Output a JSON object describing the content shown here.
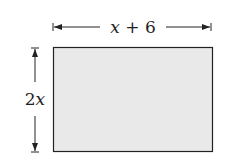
{
  "diagram": {
    "shape": "rectangle",
    "fill_color": "#e9e9e9",
    "stroke_color": "#222222",
    "width_label": {
      "var": "x",
      "rest": " + 6"
    },
    "height_label": {
      "coef": "2",
      "var": "x"
    }
  }
}
